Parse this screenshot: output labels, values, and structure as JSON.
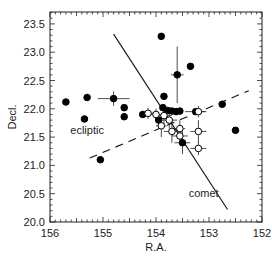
{
  "chart_data": {
    "type": "scatter",
    "title": "",
    "xlabel": "R.A.",
    "ylabel": "Decl.",
    "xlim": [
      156,
      152
    ],
    "ylim": [
      20.0,
      23.7
    ],
    "x_reversed": true,
    "grid": false,
    "x_ticks": [
      "156",
      "155",
      "154",
      "153",
      "152"
    ],
    "y_ticks": [
      "20.0",
      "20.5",
      "21.0",
      "21.5",
      "22.0",
      "22.5",
      "23.0",
      "23.5"
    ],
    "annotations": [
      {
        "text": "ecliptic",
        "x": 155.3,
        "y": 21.55
      },
      {
        "text": "comet",
        "x": 153.1,
        "y": 20.45
      }
    ],
    "lines": [
      {
        "name": "comet",
        "style": "solid",
        "points": [
          [
            154.8,
            23.32
          ],
          [
            152.65,
            20.22
          ]
        ]
      },
      {
        "name": "ecliptic",
        "style": "dashed",
        "points": [
          [
            155.25,
            21.13
          ],
          [
            152.25,
            22.32
          ]
        ]
      }
    ],
    "series": [
      {
        "name": "filled",
        "marker": "filled-circle",
        "points": [
          {
            "x": 155.7,
            "y": 22.12
          },
          {
            "x": 155.3,
            "y": 22.2
          },
          {
            "x": 155.35,
            "y": 21.82
          },
          {
            "x": 154.8,
            "y": 22.18,
            "xerr": 0.3,
            "yerr": 0.13
          },
          {
            "x": 154.6,
            "y": 22.02
          },
          {
            "x": 154.6,
            "y": 21.86
          },
          {
            "x": 155.05,
            "y": 21.1
          },
          {
            "x": 153.9,
            "y": 23.28
          },
          {
            "x": 153.6,
            "y": 22.6,
            "xerr": 0.12,
            "yerr": 0.5
          },
          {
            "x": 153.85,
            "y": 22.22
          },
          {
            "x": 153.35,
            "y": 22.75
          },
          {
            "x": 153.87,
            "y": 22.02
          },
          {
            "x": 153.78,
            "y": 21.97
          },
          {
            "x": 153.7,
            "y": 21.96
          },
          {
            "x": 153.62,
            "y": 21.95
          },
          {
            "x": 153.55,
            "y": 21.96
          },
          {
            "x": 154.25,
            "y": 21.9
          },
          {
            "x": 153.25,
            "y": 21.95,
            "xerr": 0.2
          },
          {
            "x": 152.75,
            "y": 22.08
          },
          {
            "x": 152.5,
            "y": 21.62
          },
          {
            "x": 153.95,
            "y": 21.8
          },
          {
            "x": 153.5,
            "y": 21.4,
            "xerr": 0.15,
            "yerr": 0.2
          }
        ]
      },
      {
        "name": "open",
        "marker": "open-circle",
        "points": [
          {
            "x": 154.15,
            "y": 21.92,
            "xerr": 0.15,
            "yerr": 0.1
          },
          {
            "x": 154.0,
            "y": 21.9,
            "xerr": 0.15,
            "yerr": 0.1
          },
          {
            "x": 153.85,
            "y": 21.88,
            "xerr": 0.15,
            "yerr": 0.15
          },
          {
            "x": 153.2,
            "y": 21.95,
            "xerr": 0.12,
            "yerr": 0.1
          },
          {
            "x": 153.75,
            "y": 21.8,
            "xerr": 0.15,
            "yerr": 0.15
          },
          {
            "x": 153.9,
            "y": 21.7,
            "xerr": 0.1,
            "yerr": 0.2
          },
          {
            "x": 153.7,
            "y": 21.6,
            "xerr": 0.15,
            "yerr": 0.2
          },
          {
            "x": 153.55,
            "y": 21.65,
            "xerr": 0.1,
            "yerr": 0.15
          },
          {
            "x": 153.55,
            "y": 21.52,
            "xerr": 0.15,
            "yerr": 0.15
          },
          {
            "x": 153.2,
            "y": 21.6,
            "xerr": 0.15,
            "yerr": 0.2
          },
          {
            "x": 153.2,
            "y": 21.3,
            "xerr": 0.15,
            "yerr": 0.12
          }
        ]
      }
    ]
  }
}
